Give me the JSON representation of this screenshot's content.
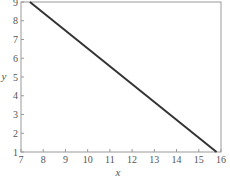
{
  "chart_data": {
    "type": "line",
    "title": "",
    "xlabel": "x",
    "ylabel": "y",
    "xlim": [
      7,
      16
    ],
    "ylim": [
      1,
      9
    ],
    "xticks": [
      7,
      8,
      9,
      10,
      11,
      12,
      13,
      14,
      15,
      16
    ],
    "yticks": [
      1,
      2,
      3,
      4,
      5,
      6,
      7,
      8,
      9
    ],
    "grid": false,
    "legend": null,
    "series": [
      {
        "name": "line",
        "x": [
          7.4,
          15.8
        ],
        "y": [
          9,
          1
        ],
        "color": "#333333"
      }
    ]
  }
}
